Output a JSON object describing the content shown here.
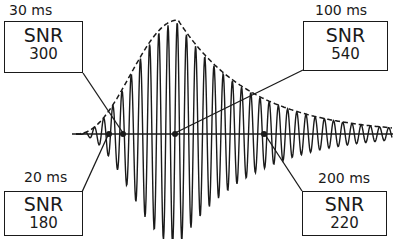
{
  "diagram": {
    "colors": {
      "ink": "#1a1a1a",
      "background": "#ffffff"
    },
    "annotations": [
      {
        "id": "t30",
        "time_label": "30 ms",
        "snr_title": "SNR",
        "snr_value": "300",
        "position": "top-left"
      },
      {
        "id": "t100",
        "time_label": "100 ms",
        "snr_title": "SNR",
        "snr_value": "540",
        "position": "top-right"
      },
      {
        "id": "t20",
        "time_label": "20 ms",
        "snr_title": "SNR",
        "snr_value": "180",
        "position": "bottom-left"
      },
      {
        "id": "t200",
        "time_label": "200 ms",
        "snr_title": "SNR",
        "snr_value": "220",
        "position": "bottom-right"
      }
    ]
  }
}
